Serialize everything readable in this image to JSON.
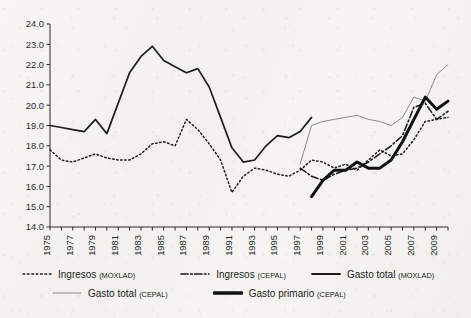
{
  "chart_data": {
    "type": "line",
    "title": "",
    "xlabel": "",
    "ylabel": "",
    "xlim": [
      1975,
      2010
    ],
    "ylim": [
      14.0,
      24.0
    ],
    "grid": false,
    "legend_position": "bottom",
    "y_ticks": [
      "14.0",
      "15.0",
      "16.0",
      "17.0",
      "18.0",
      "19.0",
      "20.0",
      "21.0",
      "22.0",
      "23.0",
      "24.0"
    ],
    "x_ticks": [
      "1975",
      "1977",
      "1979",
      "1981",
      "1983",
      "1985",
      "1987",
      "1989",
      "1991",
      "1993",
      "1995",
      "1997",
      "1999",
      "2001",
      "2003",
      "2005",
      "2007",
      "2009"
    ],
    "series": [
      {
        "name": "Ingresos",
        "source": "MOXLAD",
        "style": "dotted",
        "color": "#1d1d1d",
        "width": 1.5,
        "x": [
          1975,
          1976,
          1977,
          1978,
          1979,
          1980,
          1981,
          1982,
          1983,
          1984,
          1985,
          1986,
          1987,
          1988,
          1989,
          1990,
          1991,
          1992,
          1993,
          1994,
          1995,
          1996,
          1997,
          1998,
          1999,
          2000,
          2001,
          2002,
          2003,
          2004,
          2005,
          2006,
          2007,
          2008,
          2009,
          2010
        ],
        "values": [
          17.8,
          17.3,
          17.2,
          17.4,
          17.6,
          17.4,
          17.3,
          17.3,
          17.6,
          18.1,
          18.2,
          18.0,
          19.3,
          18.8,
          18.1,
          17.3,
          15.7,
          16.5,
          16.9,
          16.8,
          16.6,
          16.5,
          16.8,
          17.3,
          17.2,
          16.9,
          17.1,
          16.8,
          17.3,
          17.8,
          17.5,
          17.6,
          18.3,
          19.2,
          19.3,
          19.4
        ]
      },
      {
        "name": "Ingresos",
        "source": "CEPAL",
        "style": "dash-dot",
        "color": "#1d1d1d",
        "width": 1.6,
        "x": [
          1997,
          1998,
          1999,
          2000,
          2001,
          2002,
          2003,
          2004,
          2005,
          2006,
          2007,
          2008,
          2009,
          2010
        ],
        "values": [
          16.9,
          16.5,
          16.3,
          16.6,
          16.8,
          16.9,
          17.2,
          17.6,
          18.0,
          18.5,
          19.9,
          20.1,
          19.3,
          19.7
        ]
      },
      {
        "name": "Gasto total",
        "source": "MOXLAD",
        "style": "solid",
        "color": "#1d1d1d",
        "width": 1.7,
        "x": [
          1975,
          1976,
          1977,
          1978,
          1979,
          1980,
          1981,
          1982,
          1983,
          1984,
          1985,
          1986,
          1987,
          1988,
          1989,
          1990,
          1991,
          1992,
          1993,
          1994,
          1995,
          1996,
          1997,
          1998
        ],
        "values": [
          19.0,
          18.9,
          18.8,
          18.7,
          19.3,
          18.6,
          20.1,
          21.6,
          22.4,
          22.9,
          22.2,
          21.9,
          21.6,
          21.8,
          20.9,
          19.4,
          17.9,
          17.2,
          17.3,
          18.0,
          18.5,
          18.4,
          18.7,
          19.4
        ]
      },
      {
        "name": "Gasto total",
        "source": "CEPAL",
        "style": "thin",
        "color": "#8a8a8a",
        "width": 1.0,
        "x": [
          1997,
          1998,
          1999,
          2000,
          2001,
          2002,
          2003,
          2004,
          2005,
          2006,
          2007,
          2008,
          2009,
          2010
        ],
        "values": [
          17.1,
          19.0,
          19.2,
          19.3,
          19.4,
          19.5,
          19.3,
          19.2,
          19.0,
          19.4,
          20.4,
          20.2,
          21.5,
          22.0
        ]
      },
      {
        "name": "Gasto primario",
        "source": "CEPAL",
        "style": "thick",
        "color": "#111111",
        "width": 3.0,
        "x": [
          1998,
          1999,
          2000,
          2001,
          2002,
          2003,
          2004,
          2005,
          2006,
          2007,
          2008,
          2009,
          2010
        ],
        "values": [
          15.5,
          16.3,
          16.8,
          16.8,
          17.2,
          16.9,
          16.9,
          17.3,
          18.2,
          19.3,
          20.4,
          19.8,
          20.2
        ]
      }
    ]
  },
  "legend": {
    "rows": [
      [
        {
          "label": "Ingresos",
          "source": "MOXLAD",
          "style": "dotted"
        },
        {
          "label": "Ingresos",
          "source": "CEPAL",
          "style": "dash-dot"
        },
        {
          "label": "Gasto total",
          "source": "MOXLAD",
          "style": "solid"
        }
      ],
      [
        {
          "label": "Gasto total",
          "source": "CEPAL",
          "style": "thin"
        },
        {
          "label": "Gasto primario",
          "source": "CEPAL",
          "style": "thick"
        }
      ]
    ]
  }
}
